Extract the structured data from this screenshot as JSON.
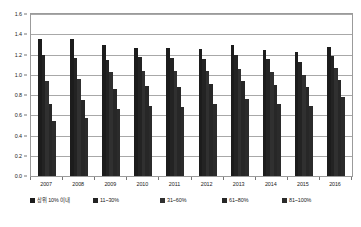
{
  "chart_data": {
    "type": "bar",
    "title": "",
    "subtitle": "",
    "xlabel": "",
    "ylabel": "",
    "categories": [
      "2007",
      "2008",
      "2009",
      "2010",
      "2011",
      "2012",
      "2013",
      "2014",
      "2015",
      "2016"
    ],
    "series": [
      {
        "name": "상위 10% 이내",
        "color": "#1c1c1c",
        "values": [
          1.35,
          1.35,
          1.29,
          1.26,
          1.26,
          1.25,
          1.29,
          1.24,
          1.22,
          1.27
        ]
      },
      {
        "name": "11~30%",
        "color": "#232323",
        "values": [
          1.2,
          1.17,
          1.15,
          1.18,
          1.17,
          1.16,
          1.2,
          1.16,
          1.13,
          1.19
        ]
      },
      {
        "name": "31~60%",
        "color": "#303030",
        "values": [
          0.94,
          0.96,
          1.03,
          1.04,
          1.04,
          1.04,
          1.06,
          1.03,
          1.0,
          1.07
        ]
      },
      {
        "name": "61~80%",
        "color": "#272727",
        "values": [
          0.71,
          0.75,
          0.86,
          0.89,
          0.88,
          0.91,
          0.94,
          0.9,
          0.88,
          0.95
        ]
      },
      {
        "name": "81~100%",
        "color": "#2b2b2b",
        "values": [
          0.54,
          0.57,
          0.66,
          0.69,
          0.68,
          0.71,
          0.76,
          0.71,
          0.69,
          0.78
        ]
      }
    ],
    "ylim": [
      0.0,
      1.6
    ],
    "y_ticks": [
      "0.0",
      "0.2",
      "0.4",
      "0.6",
      "0.8",
      "1.0",
      "1.2",
      "1.4",
      "1.6"
    ],
    "y_tick_values": [
      0.0,
      0.2,
      0.4,
      0.6,
      0.8,
      1.0,
      1.2,
      1.4,
      1.6
    ],
    "grid": true,
    "grid_axis": "y",
    "legend_position": "bottom",
    "plot_border_color": "#9b9b9b",
    "grid_color": "#a8a8a8"
  }
}
